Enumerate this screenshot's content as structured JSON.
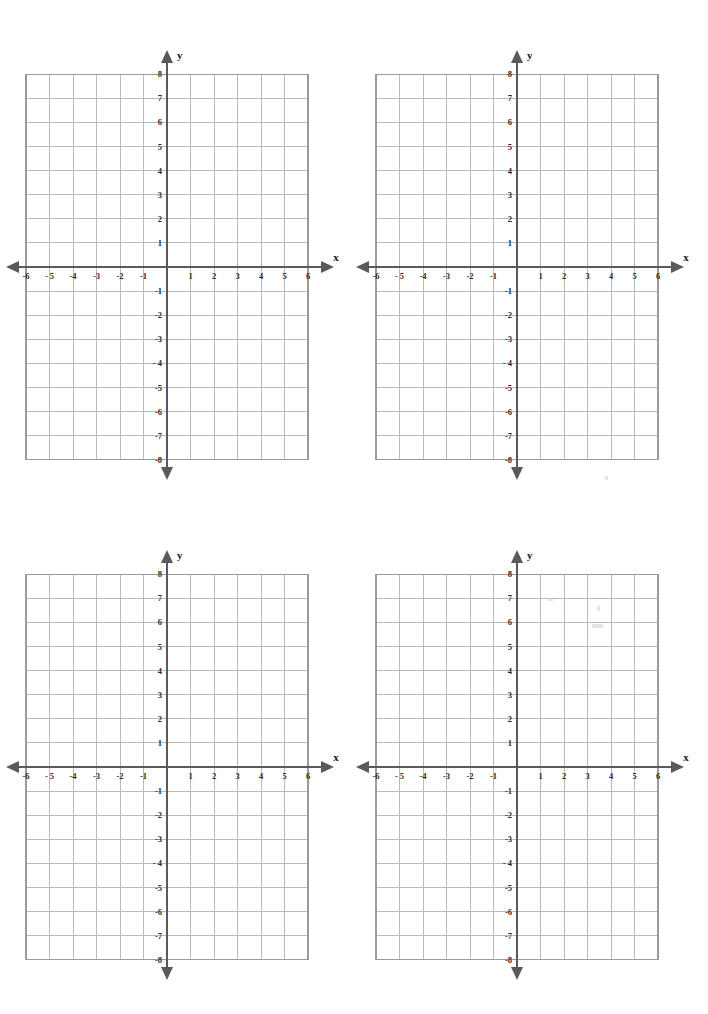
{
  "document": {
    "title": "Blank Coordinate Grid Worksheet",
    "page_background": "#ffffff",
    "grid_count": 4,
    "layout": "2x2"
  },
  "style": {
    "grid_line_color": "#b9b9b9",
    "grid_border_color": "#9a9a9a",
    "axis_color": "#5a5a5a",
    "label_color": "#2b2b2b",
    "axis_name_color": "#1a1a1a"
  },
  "chart_data": {
    "type": "scatter",
    "title": "",
    "xlabel": "x",
    "ylabel": "y",
    "xlim": [
      -6,
      6
    ],
    "ylim": [
      -8,
      8
    ],
    "grid": true,
    "legend": null,
    "series": [],
    "x_tick_values": [
      -6,
      -5,
      -4,
      -3,
      -2,
      -1,
      1,
      2,
      3,
      4,
      5,
      6
    ],
    "y_tick_values": [
      8,
      7,
      6,
      5,
      4,
      3,
      2,
      1,
      -1,
      -2,
      -3,
      -4,
      -5,
      -6,
      -7,
      -8
    ],
    "x_tick_labels": [
      "-6",
      "- 5",
      "-4",
      "-3",
      "-2",
      "-1",
      "1",
      "2",
      "3",
      "4",
      "5",
      "6"
    ],
    "y_tick_labels": [
      "8",
      "7",
      "6",
      "5",
      "4",
      "3",
      "2",
      "1",
      "-1",
      "-2",
      "-3",
      "- 4",
      "-5",
      "-6",
      "-7",
      "-8"
    ]
  },
  "grids": [
    {
      "id": "grid-1",
      "position": "top-left",
      "x_axis_label": "x",
      "y_axis_label": "y",
      "x_tick_labels": [
        "-6",
        "- 5",
        "-4",
        "-3",
        "-2",
        "-1",
        "1",
        "2",
        "3",
        "4",
        "5",
        "6"
      ],
      "y_tick_labels": [
        "8",
        "7",
        "6",
        "5",
        "4",
        "3",
        "2",
        "1",
        "-1",
        "-2",
        "-3",
        "- 4",
        "-5",
        "-6",
        "-7",
        "-8"
      ]
    },
    {
      "id": "grid-2",
      "position": "top-right",
      "x_axis_label": "x",
      "y_axis_label": "y",
      "x_tick_labels": [
        "-6",
        "- 5",
        "-4",
        "-3",
        "-2",
        "-1",
        "1",
        "2",
        "3",
        "4",
        "5",
        "6"
      ],
      "y_tick_labels": [
        "8",
        "7",
        "6",
        "5",
        "4",
        "3",
        "2",
        "1",
        "-1",
        "-2",
        "-3",
        "- 4",
        "-5",
        "-6",
        "-7",
        "-8"
      ]
    },
    {
      "id": "grid-3",
      "position": "bottom-left",
      "x_axis_label": "x",
      "y_axis_label": "y",
      "x_tick_labels": [
        "-6",
        "- 5",
        "-4",
        "-3",
        "-2",
        "-1",
        "1",
        "2",
        "3",
        "4",
        "5",
        "6"
      ],
      "y_tick_labels": [
        "8",
        "7",
        "6",
        "5",
        "4",
        "3",
        "2",
        "1",
        "-1",
        "-2",
        "-3",
        "- 4",
        "-5",
        "-6",
        "-7",
        "-8"
      ]
    },
    {
      "id": "grid-4",
      "position": "bottom-right",
      "x_axis_label": "x",
      "y_axis_label": "y",
      "x_tick_labels": [
        "-6",
        "- 5",
        "-4",
        "-3",
        "-2",
        "-1",
        "1",
        "2",
        "3",
        "4",
        "5",
        "6"
      ],
      "y_tick_labels": [
        "8",
        "7",
        "6",
        "5",
        "4",
        "3",
        "2",
        "1",
        "-1",
        "-2",
        "-3",
        "- 4",
        "-5",
        "-6",
        "-7",
        "-8"
      ]
    }
  ]
}
